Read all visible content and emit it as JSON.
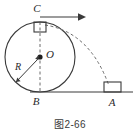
{
  "figure": {
    "caption": "图2-66",
    "stroke_color": "#3a3a3a",
    "dash_color": "#6b6b6b",
    "labels": {
      "center": "O",
      "top_point": "C",
      "bottom_point": "B",
      "landing_point": "A",
      "radius": "R"
    },
    "elements": {
      "circle_name": "circle-outline",
      "ground_name": "ground-line",
      "vertical_axis_name": "vertical-dashed-axis",
      "trajectory_name": "projectile-trajectory",
      "velocity_arrow_name": "velocity-arrow",
      "block_top_name": "block-at-c",
      "block_ground_name": "block-at-a",
      "center_dot_name": "center-point-dot",
      "radius_arrow_name": "radius-arrow"
    }
  },
  "geometry": {
    "circle_center_x": 40,
    "circle_center_y": 57,
    "circle_radius": 35,
    "top_point_x": 40,
    "top_point_y": 22,
    "bottom_point_x": 40,
    "bottom_point_y": 92,
    "landing_point_x": 112,
    "landing_point_y": 92,
    "ground_y": 92,
    "ground_x_start": 30,
    "ground_x_end": 133
  }
}
